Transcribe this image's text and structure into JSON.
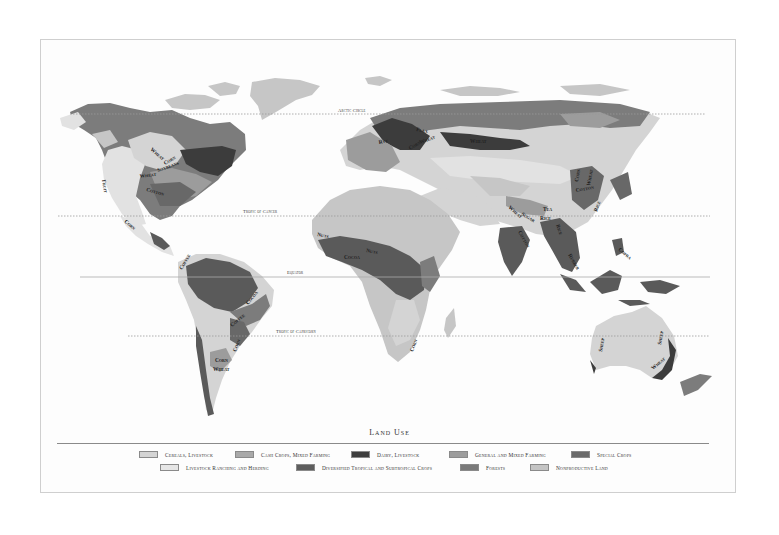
{
  "map": {
    "title": "Land Use",
    "latitude_lines": [
      {
        "label": "Arctic Circle",
        "y": 114,
        "x1": 70,
        "x2": 705,
        "label_x": 338
      },
      {
        "label": "Tropic of Cancer",
        "y": 216,
        "x1": 58,
        "x2": 710,
        "label_x": 243
      },
      {
        "label": "Equator",
        "y": 277,
        "x1": 80,
        "x2": 710,
        "label_x": 287
      },
      {
        "label": "Tropic of Capricorn",
        "y": 336,
        "x1": 128,
        "x2": 710,
        "label_x": 276
      }
    ],
    "crop_labels": [
      {
        "text": "Wheat",
        "x": 150,
        "y": 150,
        "rotate": 40
      },
      {
        "text": "Corn",
        "x": 165,
        "y": 165,
        "rotate": -30
      },
      {
        "text": "Soybeans",
        "x": 158,
        "y": 172,
        "rotate": -20
      },
      {
        "text": "Wheat",
        "x": 140,
        "y": 178,
        "rotate": -8
      },
      {
        "text": "Cotton",
        "x": 146,
        "y": 191,
        "rotate": 15
      },
      {
        "text": "Fruit",
        "x": 102,
        "y": 180,
        "rotate": 80
      },
      {
        "text": "Corn",
        "x": 124,
        "y": 222,
        "rotate": 40
      },
      {
        "text": "Rye",
        "x": 379,
        "y": 144,
        "rotate": -10
      },
      {
        "text": "Flax",
        "x": 416,
        "y": 131,
        "rotate": 10
      },
      {
        "text": "Corn",
        "x": 410,
        "y": 150,
        "rotate": -30
      },
      {
        "text": "Wheat",
        "x": 420,
        "y": 144,
        "rotate": -20
      },
      {
        "text": "Wheat",
        "x": 470,
        "y": 143,
        "rotate": 0
      },
      {
        "text": "Corn",
        "x": 578,
        "y": 182,
        "rotate": -80
      },
      {
        "text": "Wheat",
        "x": 590,
        "y": 186,
        "rotate": -80
      },
      {
        "text": "Cotton",
        "x": 576,
        "y": 192,
        "rotate": -10
      },
      {
        "text": "Rice",
        "x": 597,
        "y": 212,
        "rotate": -70
      },
      {
        "text": "Wheat",
        "x": 508,
        "y": 208,
        "rotate": 40
      },
      {
        "text": "Sugar",
        "x": 521,
        "y": 215,
        "rotate": 30
      },
      {
        "text": "Tea",
        "x": 543,
        "y": 211,
        "rotate": 0
      },
      {
        "text": "Rice",
        "x": 540,
        "y": 220,
        "rotate": 0
      },
      {
        "text": "Rice",
        "x": 556,
        "y": 225,
        "rotate": 70
      },
      {
        "text": "Cotton",
        "x": 518,
        "y": 232,
        "rotate": 60
      },
      {
        "text": "Rubber",
        "x": 568,
        "y": 255,
        "rotate": 60
      },
      {
        "text": "Copra",
        "x": 618,
        "y": 250,
        "rotate": 40
      },
      {
        "text": "Nuts",
        "x": 317,
        "y": 236,
        "rotate": 10
      },
      {
        "text": "Nuts",
        "x": 366,
        "y": 252,
        "rotate": 10
      },
      {
        "text": "Cocoa",
        "x": 344,
        "y": 259,
        "rotate": 0
      },
      {
        "text": "Coffee",
        "x": 182,
        "y": 270,
        "rotate": -60
      },
      {
        "text": "Cocoa",
        "x": 248,
        "y": 305,
        "rotate": -50
      },
      {
        "text": "Coffee",
        "x": 232,
        "y": 327,
        "rotate": -40
      },
      {
        "text": "Corn",
        "x": 236,
        "y": 352,
        "rotate": -70
      },
      {
        "text": "Corn",
        "x": 215,
        "y": 362,
        "rotate": 0
      },
      {
        "text": "Wheat",
        "x": 213,
        "y": 371,
        "rotate": 0
      },
      {
        "text": "Corn",
        "x": 413,
        "y": 352,
        "rotate": -70
      },
      {
        "text": "Sheep",
        "x": 602,
        "y": 352,
        "rotate": -80
      },
      {
        "text": "Sheep",
        "x": 661,
        "y": 345,
        "rotate": -80
      },
      {
        "text": "Wheat",
        "x": 653,
        "y": 370,
        "rotate": -40
      }
    ]
  },
  "legend": {
    "title": "Land Use",
    "row1": [
      {
        "label": "Cereals, Livestock",
        "color": "#d4d4d4"
      },
      {
        "label": "Cash Crops, Mixed Farming",
        "color": "#a9a9a9"
      },
      {
        "label": "Dairy, Livestock",
        "color": "#3e3e3e"
      },
      {
        "label": "General and Mixed Farming",
        "color": "#9d9d9d"
      },
      {
        "label": "Special Crops",
        "color": "#6a6a6a"
      }
    ],
    "row2": [
      {
        "label": "Livestock Ranching and Herding",
        "color": "#e6e6e6"
      },
      {
        "label": "Diversified Tropical and Subtropical Crops",
        "color": "#5e5e5e"
      },
      {
        "label": "Forests",
        "color": "#7a7a7a"
      },
      {
        "label": "Nonproductive Land",
        "color": "#c4c4c4"
      }
    ]
  },
  "colors": {
    "cereals_livestock": "#d4d4d4",
    "ranching": "#e2e2e2",
    "nonproductive": "#c6c6c6",
    "forests": "#7c7c7c",
    "tropical": "#5a5a5a",
    "dairy": "#3c3c3c",
    "mixed": "#9c9c9c",
    "special": "#686868",
    "cash": "#a8a8a8"
  }
}
